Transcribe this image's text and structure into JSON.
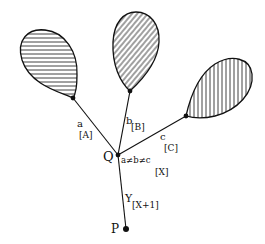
{
  "diagram": {
    "type": "tree-with-hatched-loops",
    "nodes": {
      "Q": {
        "label": "Q"
      },
      "P": {
        "label": "P"
      }
    },
    "edges": {
      "a": {
        "main": "a",
        "sub": "[A]"
      },
      "b": {
        "main": "b",
        "sub": "[B]"
      },
      "c": {
        "main": "c",
        "sub": "[C]"
      },
      "q_label": {
        "main": "a≠b≠c",
        "sub": "[X]"
      },
      "y": {
        "main": "Y",
        "sub": "[X+1]"
      }
    },
    "loops": [
      {
        "name": "loop-a",
        "hatch": "horizontal"
      },
      {
        "name": "loop-b",
        "hatch": "diagonal"
      },
      {
        "name": "loop-c",
        "hatch": "vertical"
      }
    ],
    "colors": {
      "ink": "#111111",
      "background": "#ffffff"
    }
  }
}
